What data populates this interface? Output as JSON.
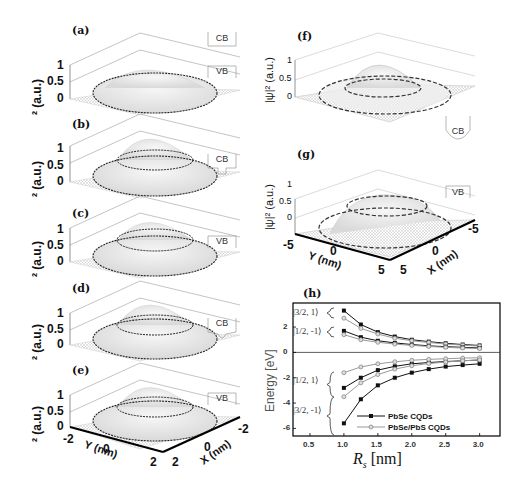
{
  "panels": {
    "a": {
      "label": "(a)",
      "zlabel": "² (a.u.)",
      "ticks": [
        "1",
        "0.5",
        "0"
      ],
      "band_top": "CB",
      "band_bottom": "VB"
    },
    "b": {
      "label": "(b)",
      "zlabel": "² (a.u.)",
      "ticks": [
        "1",
        "0.5",
        "0"
      ],
      "band": "CB"
    },
    "c": {
      "label": "(c)",
      "zlabel": "² (a.u.)",
      "ticks": [
        "1",
        "0.5",
        "0"
      ],
      "band": "VB"
    },
    "d": {
      "label": "(d)",
      "zlabel": "² (a.u.)",
      "ticks": [
        "1",
        "0.5",
        "0"
      ],
      "band": "CB"
    },
    "e": {
      "label": "(e)",
      "zlabel": "² (a.u.)",
      "ticks": [
        "1",
        "0.5",
        "0"
      ],
      "band": "VB",
      "y_axis_title": "Y (nm)",
      "x_axis_title": "X (nm)",
      "y_ticks": [
        "-2",
        "0",
        "2"
      ],
      "x_ticks": [
        "2",
        "0",
        "-2"
      ]
    },
    "f": {
      "label": "(f)",
      "zlabel": "|ψ|² (a.u.)",
      "ticks": [
        "1",
        "0.5",
        "0"
      ],
      "band": "CB"
    },
    "g": {
      "label": "(g)",
      "zlabel": "|ψ|² (a.u.)",
      "ticks": [
        "1",
        "0.5",
        "0"
      ],
      "band": "VB",
      "y_axis_title": "Y (nm)",
      "x_axis_title": "X (nm)",
      "y_ticks": [
        "-5",
        "0",
        "5"
      ],
      "x_ticks": [
        "5",
        "0",
        "-5"
      ]
    }
  },
  "chart_data": {
    "type": "line",
    "title": "(h)",
    "xlabel": "R_s [nm]",
    "ylabel": "Energy [eV]",
    "xlim": [
      0.25,
      3.3
    ],
    "ylim": [
      -6.6,
      3.9
    ],
    "x_ticks": [
      "0.5",
      "1.0",
      "1.5",
      "2.0",
      "2.5",
      "3.0"
    ],
    "y_ticks": [
      "2",
      "0",
      "-2",
      "-4",
      "-6"
    ],
    "x": [
      1.0,
      1.25,
      1.5,
      1.75,
      2.0,
      2.25,
      2.5,
      2.75,
      3.0
    ],
    "state_labels": [
      "|3/2, 1⟩",
      "|1/2, -1⟩",
      "|1/2, 1⟩",
      "|3/2, -1⟩"
    ],
    "legend": [
      "PbSe CQDs",
      "PbSe/PbS CQDs"
    ],
    "legend_position": "lower right",
    "series": [
      {
        "name": "PbSe CQDs |3/2,1⟩",
        "group": "PbSe CQDs",
        "values": [
          3.3,
          2.2,
          1.6,
          1.25,
          1.0,
          0.85,
          0.72,
          0.62,
          0.55
        ]
      },
      {
        "name": "PbSe/PbS CQDs |3/2,1⟩",
        "group": "PbSe/PbS CQDs",
        "values": [
          2.7,
          1.9,
          1.45,
          1.12,
          0.92,
          0.78,
          0.66,
          0.57,
          0.5
        ]
      },
      {
        "name": "PbSe CQDs |1/2,-1⟩",
        "group": "PbSe CQDs",
        "values": [
          1.7,
          1.2,
          0.92,
          0.75,
          0.62,
          0.52,
          0.45,
          0.4,
          0.35
        ]
      },
      {
        "name": "PbSe/PbS CQDs |1/2,-1⟩",
        "group": "PbSe/PbS CQDs",
        "values": [
          1.4,
          1.0,
          0.8,
          0.66,
          0.55,
          0.47,
          0.4,
          0.35,
          0.3
        ]
      },
      {
        "name": "PbSe CQDs |1/2,1⟩",
        "group": "PbSe CQDs",
        "values": [
          -2.8,
          -2.0,
          -1.4,
          -1.1,
          -0.9,
          -0.8,
          -0.72,
          -0.66,
          -0.6
        ]
      },
      {
        "name": "PbSe/PbS CQDs |1/2,1⟩",
        "group": "PbSe/PbS CQDs",
        "values": [
          -1.6,
          -1.15,
          -0.9,
          -0.74,
          -0.62,
          -0.55,
          -0.5,
          -0.45,
          -0.42
        ]
      },
      {
        "name": "PbSe CQDs |3/2,-1⟩",
        "group": "PbSe CQDs",
        "values": [
          -5.6,
          -3.7,
          -2.6,
          -2.0,
          -1.6,
          -1.32,
          -1.12,
          -1.0,
          -0.9
        ]
      },
      {
        "name": "PbSe/PbS CQDs |3/2,-1⟩",
        "group": "PbSe/PbS CQDs",
        "values": [
          -3.5,
          -2.4,
          -1.75,
          -1.32,
          -1.05,
          -0.88,
          -0.76,
          -0.66,
          -0.6
        ]
      }
    ],
    "grid": false
  }
}
